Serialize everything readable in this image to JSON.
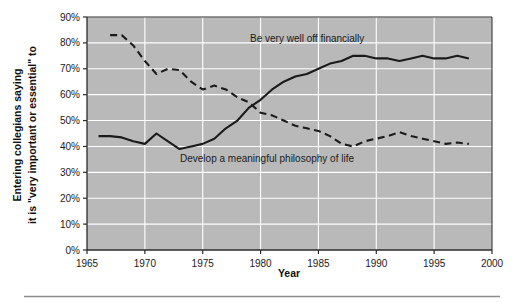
{
  "figure": {
    "background_color": "#ffffff",
    "plot_background_color": "#b9b9b9",
    "gridline_color": "#ffffff",
    "axis_color": "#2b2b2b",
    "line_color": "#1a1a1a",
    "divider_color": "#8c8c8c"
  },
  "axes": {
    "y_title": "Entering collegians saying it is \"very important or essential\" to",
    "x_title": "Year",
    "y_ticks": [
      "0%",
      "10%",
      "20%",
      "30%",
      "40%",
      "50%",
      "60%",
      "70%",
      "80%",
      "90%"
    ],
    "x_ticks": [
      "1965",
      "1970",
      "1975",
      "1980",
      "1985",
      "1990",
      "1995",
      "2000"
    ]
  },
  "annotations": {
    "financially": "Be very well off financially",
    "philosophy": "Develop a meaningful philosophy of life"
  },
  "chart_data": {
    "type": "line",
    "title": "",
    "subtitle": "",
    "xlabel": "Year",
    "ylabel": "Entering collegians saying it is \"very important or essential\" to",
    "xlim": [
      1965,
      2000
    ],
    "ylim": [
      0,
      90
    ],
    "y_unit": "percent",
    "grid": true,
    "legend": "inline-annotations",
    "x_ticks": [
      1965,
      1970,
      1975,
      1980,
      1985,
      1990,
      1995,
      2000
    ],
    "y_ticks": [
      0,
      10,
      20,
      30,
      40,
      50,
      60,
      70,
      80,
      90
    ],
    "series": [
      {
        "name": "Be very well off financially",
        "style": "solid",
        "color": "#1a1a1a",
        "x": [
          1966,
          1967,
          1968,
          1969,
          1970,
          1971,
          1972,
          1973,
          1974,
          1975,
          1976,
          1977,
          1978,
          1979,
          1980,
          1981,
          1982,
          1983,
          1984,
          1985,
          1986,
          1987,
          1988,
          1989,
          1990,
          1991,
          1992,
          1993,
          1994,
          1995,
          1996,
          1997,
          1998
        ],
        "values": [
          44,
          44,
          43.5,
          42,
          41,
          45,
          42,
          39,
          40,
          41,
          43,
          47,
          50,
          55,
          58,
          62,
          65,
          67,
          68,
          70,
          72,
          73,
          75,
          75,
          74,
          74,
          73,
          74,
          75,
          74,
          74,
          75,
          74
        ]
      },
      {
        "name": "Develop a meaningful philosophy of life",
        "style": "dashed",
        "color": "#1a1a1a",
        "x": [
          1967,
          1968,
          1969,
          1970,
          1971,
          1972,
          1973,
          1974,
          1975,
          1976,
          1977,
          1978,
          1979,
          1980,
          1981,
          1982,
          1983,
          1984,
          1985,
          1986,
          1987,
          1988,
          1989,
          1990,
          1991,
          1992,
          1993,
          1994,
          1995,
          1996,
          1997,
          1998
        ],
        "values": [
          83,
          83,
          79,
          73,
          68,
          70,
          69.5,
          65,
          62,
          63.5,
          62,
          59,
          57,
          53,
          52,
          50,
          48,
          47,
          46,
          44,
          41,
          40,
          42,
          43,
          44,
          45.5,
          44,
          43,
          42,
          41,
          41.5,
          41
        ]
      }
    ]
  }
}
